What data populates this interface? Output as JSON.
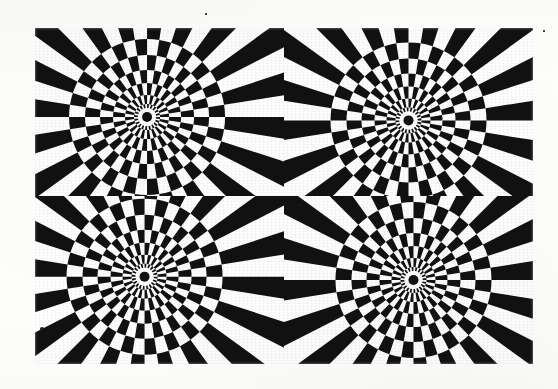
{
  "artwork": {
    "title": "Radial Sunburst Op-Art Tiling",
    "medium_description": "Black and white high-contrast optical illusion print",
    "background_color": "#fdfdfb",
    "ink_color": "#111111",
    "paper_color": "#ffffff",
    "block": {
      "x": 35,
      "y": 28,
      "width": 498,
      "height": 336
    },
    "grid": {
      "columns": 2,
      "rows": 2,
      "panel_count": 4
    },
    "panels": [
      {
        "id": "panel-tl",
        "name": "Top Left Sunburst",
        "position": "top-left",
        "center_x_pct": 45,
        "center_y_pct": 53,
        "spoke_count": 40,
        "hub_dot_radius": 5,
        "hub_ring_radius": 9,
        "ring_radii": [
          13,
          22,
          34,
          47,
          62,
          78
        ],
        "start_phase": 0
      },
      {
        "id": "panel-tr",
        "name": "Top Right Sunburst",
        "position": "top-right",
        "center_x_pct": 50,
        "center_y_pct": 55,
        "spoke_count": 40,
        "hub_dot_radius": 5,
        "hub_ring_radius": 9,
        "ring_radii": [
          13,
          22,
          34,
          47,
          62,
          78
        ],
        "start_phase": 1
      },
      {
        "id": "panel-bl",
        "name": "Bottom Left Sunburst",
        "position": "bottom-left",
        "center_x_pct": 44,
        "center_y_pct": 48,
        "spoke_count": 40,
        "hub_dot_radius": 5,
        "hub_ring_radius": 9,
        "ring_radii": [
          13,
          22,
          34,
          47,
          62,
          78
        ],
        "start_phase": 0
      },
      {
        "id": "panel-br",
        "name": "Bottom Right Sunburst",
        "position": "bottom-right",
        "center_x_pct": 52,
        "center_y_pct": 50,
        "spoke_count": 40,
        "hub_dot_radius": 5,
        "hub_ring_radius": 9,
        "ring_radii": [
          13,
          22,
          34,
          47,
          62,
          78
        ],
        "start_phase": 1
      }
    ],
    "specks": [
      {
        "x": 42,
        "y": 329,
        "r": 2.0
      },
      {
        "x": 47,
        "y": 332,
        "r": 1.3
      },
      {
        "x": 206,
        "y": 14,
        "r": 0.8
      },
      {
        "x": 336,
        "y": 317,
        "r": 0.9
      },
      {
        "x": 300,
        "y": 206,
        "r": 0.7
      },
      {
        "x": 544,
        "y": 31,
        "r": 0.7
      },
      {
        "x": 527,
        "y": 118,
        "r": 0.8
      }
    ]
  }
}
